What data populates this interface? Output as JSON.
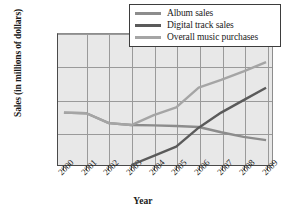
{
  "chart_data": {
    "type": "line",
    "title": "",
    "xlabel": "Year",
    "ylabel": "Sales (in millions of dollars)",
    "x": [
      2000,
      2001,
      2002,
      2003,
      2004,
      2005,
      2006,
      2007,
      2008,
      2009
    ],
    "xticklabels": [
      "2000",
      "2001",
      "2002",
      "2003",
      "2004",
      "2005",
      "2006",
      "2007",
      "2008",
      "2009"
    ],
    "yticklabels": [
      "0",
      "500",
      "1,000",
      "1,500",
      "2,000"
    ],
    "yticks": [
      0,
      500,
      1000,
      1500,
      2000
    ],
    "ylim": [
      0,
      2000
    ],
    "grid": true,
    "legend_position": "top-right",
    "plot_background": "#e8e8e8",
    "series": [
      {
        "name": "Album sales",
        "color": "#8c8c8c",
        "values": [
          800,
          790,
          640,
          610,
          605,
          595,
          580,
          500,
          430,
          380
        ]
      },
      {
        "name": "Digital track sales",
        "color": "#5a5a5a",
        "values": [
          null,
          null,
          null,
          0,
          140,
          280,
          570,
          800,
          990,
          1180
        ]
      },
      {
        "name": "Overall music purchases",
        "color": "#a5a5a5",
        "values": [
          800,
          790,
          640,
          610,
          760,
          880,
          1180,
          1300,
          1430,
          1570
        ]
      }
    ]
  },
  "legend": {
    "items": [
      {
        "label": "Album sales",
        "color": "#8c8c8c"
      },
      {
        "label": "Digital track sales",
        "color": "#5a5a5a"
      },
      {
        "label": "Overall music purchases",
        "color": "#a5a5a5"
      }
    ]
  },
  "axes": {
    "y_title": "Sales (in millions of dollars)",
    "x_title": "Year"
  }
}
